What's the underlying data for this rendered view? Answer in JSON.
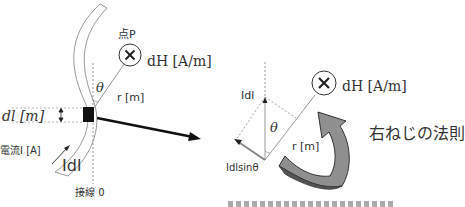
{
  "diagram": {
    "left": {
      "point_label": "点P",
      "field_label": "dH [A/m]",
      "theta_label": "θ",
      "r_label": "r [m]",
      "dl_label": "dl [m]",
      "current_label": "電流I [A]",
      "idl_label": "Idl",
      "tangent_label": "接線 0"
    },
    "right": {
      "idl_label": "Idl",
      "theta_label": "θ",
      "r_label": "r [m]",
      "idlsin_label": "Idlsinθ",
      "field_label": "dH [A/m]",
      "rule_label": "右ねじの法則"
    },
    "footer_caption": "（切り取られた注記）",
    "colors": {
      "line": "#999999",
      "dark": "#111111",
      "arrow_fill": "#8a8a8a",
      "arrow_dark": "#5a5a5a"
    }
  }
}
